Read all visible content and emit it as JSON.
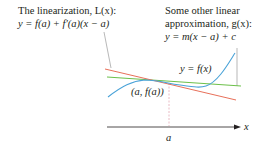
{
  "figure": {
    "linearization_label": {
      "line1": "The linearization, L(x):",
      "line2": "y = f(a) + f′(a)(x − a)"
    },
    "other_label": {
      "line1": "Some other linear",
      "line2": "approximation, g(x):",
      "line3": "y = m(x − a) + c"
    },
    "curve_label": "y = f(x)",
    "point_label": "(a, f(a))",
    "axis_label_x": "x",
    "tick_label_a": "a",
    "colors": {
      "curve_f": "#4aa3d8",
      "linearization_L": "#e8705a",
      "other_g": "#6cc04a",
      "axis": "#231f20",
      "leader": "#9a9a9a",
      "dashed_guide": "#e3a9b5"
    }
  }
}
